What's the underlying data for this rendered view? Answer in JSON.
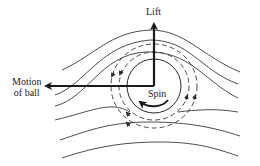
{
  "diagram": {
    "labels": {
      "lift": "Lift",
      "motion_line1": "Motion",
      "motion_line2": "of ball",
      "spin": "Spin"
    },
    "colors": {
      "stroke": "#2a2a2a",
      "background": "#ffffff"
    },
    "elements": {
      "ball": "circle",
      "lift_arrow": "upward arrow",
      "motion_arrow": "leftward arrow",
      "spin_arrow": "curved counter-clockwise arrow",
      "circulation_lines": "dashed concentric circles",
      "streamlines": "flow lines bending over ball"
    }
  }
}
